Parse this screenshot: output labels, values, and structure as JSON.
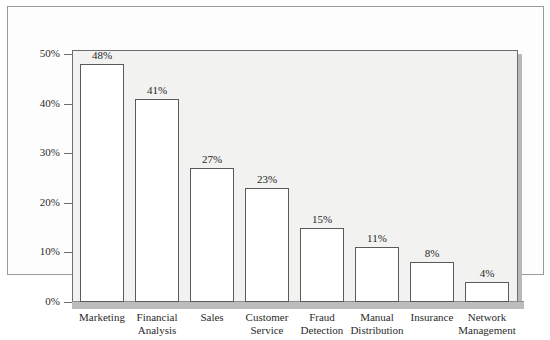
{
  "chart_data": {
    "type": "bar",
    "title": "",
    "subtitle": "",
    "xlabel": "",
    "ylabel": "",
    "ylim": [
      0,
      50
    ],
    "ytick_step": 10,
    "grid": false,
    "legend": "none",
    "orientation": "vertical",
    "value_suffix": "%",
    "categories": [
      "Marketing",
      "Financial Analysis",
      "Sales",
      "Customer Service",
      "Fraud Detection",
      "Manual Distribution",
      "Insurance",
      "Network Management"
    ],
    "category_lines": [
      [
        "Marketing"
      ],
      [
        "Financial",
        "Analysis"
      ],
      [
        "Sales"
      ],
      [
        "Customer",
        "Service"
      ],
      [
        "Fraud",
        "Detection"
      ],
      [
        "Manual",
        "Distribution"
      ],
      [
        "Insurance"
      ],
      [
        "Network",
        "Management"
      ]
    ],
    "values": [
      48,
      41,
      27,
      23,
      15,
      11,
      8,
      4
    ],
    "value_labels": [
      "48%",
      "41%",
      "27%",
      "23%",
      "15%",
      "11%",
      "8%",
      "4%"
    ],
    "ytick_labels": [
      "50%",
      "40%",
      "30%",
      "20%",
      "10%",
      "0%"
    ],
    "ytick_values": [
      50,
      40,
      30,
      20,
      10,
      0
    ],
    "colors": {
      "bar_fill": "#ffffff",
      "bar_stroke": "#5a5a5a",
      "plot_background": "#f2f2f0",
      "plot_border": "#6d6d6d",
      "baseline": "#bdbdbd",
      "frame_border": "#9a9a9a",
      "text": "#2b2b2b"
    }
  }
}
